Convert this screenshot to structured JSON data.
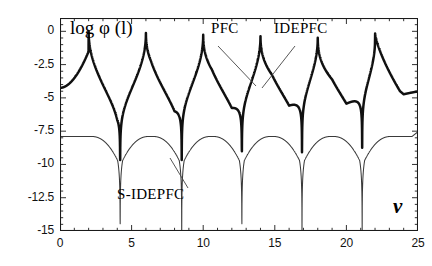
{
  "chart_data": {
    "type": "line",
    "title": "",
    "xlabel": "v",
    "ylabel": "log φ (l)",
    "xlim": [
      0,
      25
    ],
    "ylim": [
      -15,
      1
    ],
    "xticks": [
      0,
      5,
      10,
      15,
      20,
      25
    ],
    "xticklabels": [
      "0",
      "5",
      "10",
      "15",
      "20",
      "25"
    ],
    "yticks": [
      0,
      -2.5,
      -5,
      -7.5,
      -10,
      -12.5,
      -15
    ],
    "yticklabels": [
      "0",
      "-2.5",
      "-5",
      "-7.5",
      "-10",
      "-12.5",
      "-15"
    ],
    "grid": false,
    "legend_position": "annotations-inline",
    "annotations": [
      {
        "text": "PFC",
        "x": 12.2,
        "y": 0.4,
        "points_to_x": 14.0,
        "points_to_y": -4.4
      },
      {
        "text": "IDEPFC",
        "x": 16.6,
        "y": 0.4,
        "points_to_x": 14.0,
        "points_to_y": -4.4
      },
      {
        "text": "S-IDEPFC",
        "x": 5.2,
        "y": -13.0,
        "points_to_x": 8.55,
        "points_to_y": -9.6
      }
    ],
    "series": [
      {
        "name": "PFC / IDEPFC",
        "style": "thick",
        "description": "Upper heavy curve: sharp resonance peaks reaching log phi = 0 at v = 6, 10, 14, 18, 22 (first peak at v = 2 reaches -1.5), with narrow cusp minima near -10.5 at v = 4.2, 8.5, 12.7, 16.9, 21.1",
        "peaks_x": [
          2,
          6,
          10,
          14,
          18,
          22
        ],
        "peaks_y": [
          -1.5,
          0.1,
          0.1,
          0.1,
          0.1,
          0.1
        ],
        "minima_x": [
          4.2,
          8.5,
          12.7,
          16.9,
          21.1
        ],
        "minima_y": [
          -10.5,
          -10.5,
          -10.5,
          -10.5,
          -10.5
        ],
        "start_y": -4.2,
        "end_y": -6.6
      },
      {
        "name": "S-IDEPFC",
        "style": "thin",
        "description": "Lower light curve: rounded humps topping near -7.9 between deep narrow minima descending to -15 at v = 4.2, 8.5, 12.7, 16.9, 21.1",
        "peaks_x": [
          6.3,
          10.6,
          14.8,
          19.0,
          24.0
        ],
        "peaks_y": [
          -7.9,
          -7.9,
          -7.9,
          -7.9,
          -7.6
        ],
        "minima_x": [
          4.2,
          8.5,
          12.7,
          16.9,
          21.1
        ],
        "minima_y": [
          -15.2,
          -15.2,
          -15.2,
          -15.2,
          -15.2
        ],
        "start_y": -4.4,
        "end_y": -7.6
      }
    ]
  },
  "axes": {
    "y_label": "log φ (l)",
    "x_label": "v",
    "y_tick_labels": [
      "0",
      "-2.5",
      "-5",
      "-7.5",
      "-10",
      "-12.5",
      "-15"
    ],
    "x_tick_labels": [
      "0",
      "5",
      "10",
      "15",
      "20",
      "25"
    ]
  },
  "annotations": {
    "pfc": "PFC",
    "idepfc": "IDEPFC",
    "sidepfc": "S-IDEPFC"
  },
  "colors": {
    "curve_thick": "#101010",
    "curve_thin": "#3a3a3a",
    "frame": "#1a1a1a",
    "background": "#ffffff"
  }
}
